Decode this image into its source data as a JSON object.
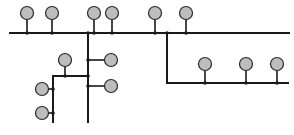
{
  "diagram": {
    "type": "bus-topology",
    "colors": {
      "line": "#1a1a1a",
      "node_fill": "#bdbdbd",
      "node_stroke": "#2a2a2a",
      "junction": "#1a1a1a",
      "background": "#ffffff"
    },
    "node_radius": 6.5,
    "buses": [
      {
        "id": "main-bus",
        "x1": 10,
        "y1": 33,
        "x2": 289,
        "y2": 33
      },
      {
        "id": "trunk-vertical",
        "x1": 88,
        "y1": 33,
        "x2": 88,
        "y2": 122
      },
      {
        "id": "right-vertical",
        "x1": 167,
        "y1": 33,
        "x2": 167,
        "y2": 83
      },
      {
        "id": "right-bus",
        "x1": 167,
        "y1": 83,
        "x2": 288,
        "y2": 83
      },
      {
        "id": "left-bus",
        "x1": 53,
        "y1": 76,
        "x2": 88,
        "y2": 76
      },
      {
        "id": "left-vertical",
        "x1": 53,
        "y1": 76,
        "x2": 53,
        "y2": 122
      }
    ],
    "nodes": [
      {
        "id": "top-node-1",
        "cx": 27,
        "cy": 13,
        "jx": 27,
        "jy": 33
      },
      {
        "id": "top-node-2",
        "cx": 52,
        "cy": 13,
        "jx": 52,
        "jy": 33
      },
      {
        "id": "top-node-3",
        "cx": 94,
        "cy": 13,
        "jx": 94,
        "jy": 33
      },
      {
        "id": "top-node-4",
        "cx": 112,
        "cy": 13,
        "jx": 112,
        "jy": 33
      },
      {
        "id": "top-node-5",
        "cx": 155,
        "cy": 13,
        "jx": 155,
        "jy": 33
      },
      {
        "id": "top-node-6",
        "cx": 186,
        "cy": 13,
        "jx": 186,
        "jy": 33
      },
      {
        "id": "right-bus-node-1",
        "cx": 205,
        "cy": 64,
        "jx": 205,
        "jy": 83
      },
      {
        "id": "right-bus-node-2",
        "cx": 246,
        "cy": 64,
        "jx": 246,
        "jy": 83
      },
      {
        "id": "right-bus-node-3",
        "cx": 277,
        "cy": 64,
        "jx": 277,
        "jy": 83
      },
      {
        "id": "trunk-node-upper",
        "cx": 111,
        "cy": 60,
        "jx": 88,
        "jy": 60
      },
      {
        "id": "trunk-node-lower",
        "cx": 111,
        "cy": 86,
        "jx": 88,
        "jy": 86
      },
      {
        "id": "left-bus-node",
        "cx": 65,
        "cy": 60,
        "jx": 65,
        "jy": 76
      },
      {
        "id": "left-vertical-node-upper",
        "cx": 42,
        "cy": 89,
        "jx": 53,
        "jy": 89
      },
      {
        "id": "left-vertical-node-lower",
        "cx": 42,
        "cy": 113,
        "jx": 53,
        "jy": 113
      }
    ],
    "junctions": [
      {
        "x": 88,
        "y": 33
      },
      {
        "x": 167,
        "y": 33
      },
      {
        "x": 88,
        "y": 76
      }
    ]
  }
}
